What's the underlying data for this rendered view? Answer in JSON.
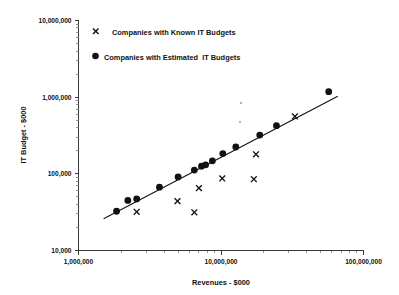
{
  "chart_data": {
    "type": "scatter",
    "title": "",
    "xlabel": "Revenues - $000",
    "ylabel": "IT Budget - $000",
    "xscale": "log",
    "yscale": "log",
    "xlim": [
      1000000,
      100000000
    ],
    "ylim": [
      10000,
      10000000
    ],
    "xticks": [
      "1,000,000",
      "10,000,000",
      "100,000,000"
    ],
    "xtick_values": [
      1000000,
      10000000,
      100000000
    ],
    "yticks": [
      "10,000",
      "100,000",
      "1,000,000",
      "10,000,000"
    ],
    "ytick_values": [
      10000,
      100000,
      1000000,
      10000000
    ],
    "grid": false,
    "legend_position": "top-left-inside",
    "series": [
      {
        "name": "Companies with Known IT Budgets",
        "marker": "x",
        "color": "#111111",
        "points": [
          {
            "x": 2560000,
            "y": 32000
          },
          {
            "x": 4950000,
            "y": 44000
          },
          {
            "x": 6500000,
            "y": 31500
          },
          {
            "x": 7000000,
            "y": 65000
          },
          {
            "x": 10200000,
            "y": 87000
          },
          {
            "x": 17000000,
            "y": 85000
          },
          {
            "x": 17600000,
            "y": 180000
          },
          {
            "x": 33000000,
            "y": 560000
          }
        ]
      },
      {
        "name": "Companies with Estimated  IT Budgets",
        "marker": "circle",
        "color": "#111111",
        "points": [
          {
            "x": 1850000,
            "y": 32500
          },
          {
            "x": 2220000,
            "y": 45000
          },
          {
            "x": 2560000,
            "y": 47000
          },
          {
            "x": 3700000,
            "y": 67000
          },
          {
            "x": 5000000,
            "y": 91000
          },
          {
            "x": 6500000,
            "y": 112000
          },
          {
            "x": 7300000,
            "y": 126000
          },
          {
            "x": 7800000,
            "y": 131000
          },
          {
            "x": 8700000,
            "y": 148000
          },
          {
            "x": 10300000,
            "y": 184000
          },
          {
            "x": 12700000,
            "y": 224000
          },
          {
            "x": 18700000,
            "y": 320000
          },
          {
            "x": 24500000,
            "y": 425000
          },
          {
            "x": 57000000,
            "y": 1180000
          }
        ]
      }
    ],
    "trend_line": {
      "name": "fit-line",
      "from": {
        "x": 1500000,
        "y": 26000
      },
      "to": {
        "x": 66000000,
        "y": 1030000
      }
    },
    "annotations": [
      {
        "name": "speck-artifact-upper",
        "x_px": 241,
        "y_px": 103
      },
      {
        "name": "speck-artifact-lower",
        "x_px": 240,
        "y_px": 122
      }
    ]
  },
  "legend": {
    "items": [
      {
        "marker": "x",
        "label": "Companies with Known IT Budgets"
      },
      {
        "marker": "circle",
        "label": "Companies with Estimated  IT Budgets"
      }
    ]
  },
  "axes": {
    "x": {
      "title": "Revenues - $000",
      "tick_labels": [
        "1,000,000",
        "10,000,000",
        "100,000,000"
      ]
    },
    "y": {
      "title": "IT Budget - $000",
      "tick_labels": [
        "10,000",
        "100,000",
        "1,000,000",
        "10,000,000"
      ]
    }
  },
  "colors": {
    "marker": "#111111",
    "axis": "#3a3a3a",
    "background": "#ffffff"
  }
}
